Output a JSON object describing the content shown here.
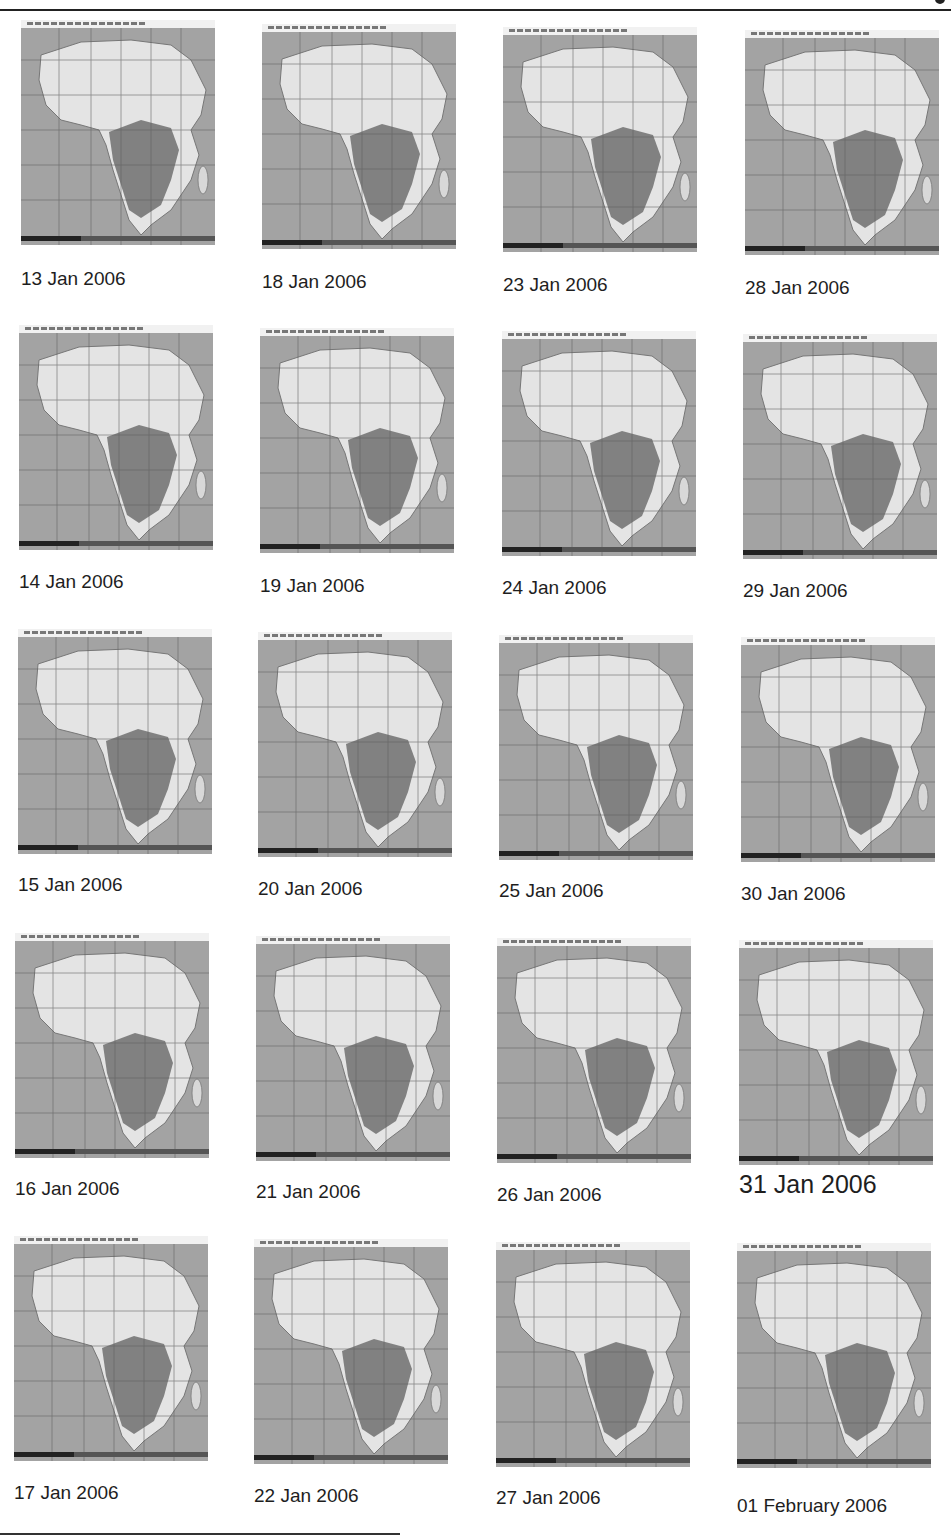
{
  "panels": [
    {
      "label": "13 Jan 2006",
      "x": 21,
      "y": 20,
      "cap_y": 268
    },
    {
      "label": "14 Jan 2006",
      "x": 19,
      "y": 325,
      "cap_y": 571
    },
    {
      "label": "15 Jan 2006",
      "x": 18,
      "y": 629,
      "cap_y": 874
    },
    {
      "label": "16 Jan 2006",
      "x": 15,
      "y": 933,
      "cap_y": 1178
    },
    {
      "label": "17 Jan 2006",
      "x": 14,
      "y": 1236,
      "cap_y": 1482
    },
    {
      "label": "18 Jan 2006",
      "x": 262,
      "y": 24,
      "cap_y": 271
    },
    {
      "label": "19 Jan 2006",
      "x": 260,
      "y": 328,
      "cap_y": 575
    },
    {
      "label": "20 Jan 2006",
      "x": 258,
      "y": 632,
      "cap_y": 878
    },
    {
      "label": "21 Jan 2006",
      "x": 256,
      "y": 936,
      "cap_y": 1181
    },
    {
      "label": "22 Jan 2006",
      "x": 254,
      "y": 1239,
      "cap_y": 1485
    },
    {
      "label": "23 Jan 2006",
      "x": 503,
      "y": 27,
      "cap_y": 274
    },
    {
      "label": "24 Jan 2006",
      "x": 502,
      "y": 331,
      "cap_y": 577
    },
    {
      "label": "25 Jan 2006",
      "x": 499,
      "y": 635,
      "cap_y": 880
    },
    {
      "label": "26 Jan 2006",
      "x": 497,
      "y": 938,
      "cap_y": 1184
    },
    {
      "label": "27 Jan 2006",
      "x": 496,
      "y": 1242,
      "cap_y": 1487
    },
    {
      "label": "28 Jan 2006",
      "x": 745,
      "y": 30,
      "cap_y": 277
    },
    {
      "label": "29 Jan 2006",
      "x": 743,
      "y": 334,
      "cap_y": 580
    },
    {
      "label": "30 Jan 2006",
      "x": 741,
      "y": 637,
      "cap_y": 883
    },
    {
      "label": "31 Jan 2006",
      "x": 739,
      "y": 940,
      "cap_y": 1170,
      "big": true
    },
    {
      "label": "01 February 2006",
      "x": 737,
      "y": 1243,
      "cap_y": 1495
    }
  ]
}
